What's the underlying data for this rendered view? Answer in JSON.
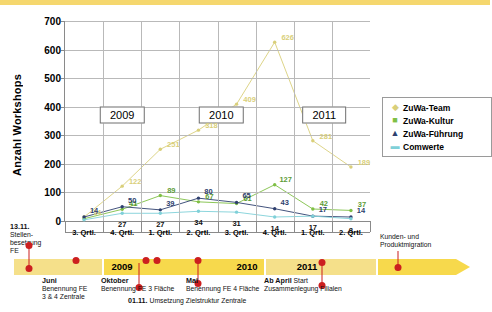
{
  "chart_data": {
    "type": "line",
    "title": "",
    "xlabel": "",
    "ylabel": "Anzahl Workshops",
    "ylim": [
      0,
      700
    ],
    "yticks": [
      0,
      100,
      200,
      300,
      400,
      500,
      600,
      700
    ],
    "grid": true,
    "legend_position": "right",
    "categories": [
      "3. Qrtl.",
      "4. Qrtl.",
      "1. Qrtl.",
      "2. Qrtl.",
      "3. Qrtl.",
      "4. Qrtl.",
      "1. Qrtl.",
      "2. Qrtl."
    ],
    "series": [
      {
        "name": "ZuWa-Team",
        "color": "#d9cf7a",
        "values": [
          14,
          122,
          251,
          318,
          409,
          626,
          281,
          189
        ]
      },
      {
        "name": "ZuWa-Kultur",
        "color": "#7fbf45",
        "values": [
          8,
          41,
          89,
          67,
          61,
          127,
          42,
          37
        ]
      },
      {
        "name": "ZuWa-Führung",
        "color": "#2e3f6e",
        "values": [
          14,
          50,
          39,
          80,
          65,
          43,
          17,
          14
        ]
      },
      {
        "name": "Comwerte",
        "color": "#7fd0d8",
        "values": [
          4,
          27,
          27,
          34,
          31,
          14,
          17,
          8
        ]
      }
    ],
    "year_bands": [
      {
        "label": "2009",
        "x_index": 1.0
      },
      {
        "label": "2010",
        "x_index": 3.6
      },
      {
        "label": "2011",
        "x_index": 6.3
      }
    ],
    "point_labels": [
      {
        "series": "ZuWa-Team",
        "index": 0,
        "text": "14"
      },
      {
        "series": "ZuWa-Team",
        "index": 1,
        "text": "122"
      },
      {
        "series": "ZuWa-Team",
        "index": 2,
        "text": "251"
      },
      {
        "series": "ZuWa-Team",
        "index": 3,
        "text": "318"
      },
      {
        "series": "ZuWa-Team",
        "index": 4,
        "text": "409"
      },
      {
        "series": "ZuWa-Team",
        "index": 5,
        "text": "626"
      },
      {
        "series": "ZuWa-Team",
        "index": 6,
        "text": "281"
      },
      {
        "series": "ZuWa-Team",
        "index": 7,
        "text": "189"
      },
      {
        "series": "ZuWa-Kultur",
        "index": 1,
        "text": "41"
      },
      {
        "series": "ZuWa-Kultur",
        "index": 2,
        "text": "89"
      },
      {
        "series": "ZuWa-Kultur",
        "index": 3,
        "text": "67"
      },
      {
        "series": "ZuWa-Kultur",
        "index": 4,
        "text": "61"
      },
      {
        "series": "ZuWa-Kultur",
        "index": 5,
        "text": "127"
      },
      {
        "series": "ZuWa-Kultur",
        "index": 6,
        "text": "42"
      },
      {
        "series": "ZuWa-Kultur",
        "index": 7,
        "text": "37"
      },
      {
        "series": "ZuWa-Führung",
        "index": 0,
        "text": "14"
      },
      {
        "series": "ZuWa-Führung",
        "index": 1,
        "text": "50"
      },
      {
        "series": "ZuWa-Führung",
        "index": 2,
        "text": "39"
      },
      {
        "series": "ZuWa-Führung",
        "index": 3,
        "text": "80"
      },
      {
        "series": "ZuWa-Führung",
        "index": 4,
        "text": "65"
      },
      {
        "series": "ZuWa-Führung",
        "index": 5,
        "text": "43"
      },
      {
        "series": "ZuWa-Führung",
        "index": 6,
        "text": "17"
      },
      {
        "series": "ZuWa-Führung",
        "index": 7,
        "text": "14"
      },
      {
        "series": "Comwerte",
        "index": 1,
        "text": "27"
      },
      {
        "series": "Comwerte",
        "index": 2,
        "text": "27"
      },
      {
        "series": "Comwerte",
        "index": 3,
        "text": "34"
      },
      {
        "series": "Comwerte",
        "index": 4,
        "text": "31"
      },
      {
        "series": "Comwerte",
        "index": 5,
        "text": "14"
      },
      {
        "series": "Comwerte",
        "index": 6,
        "text": "17"
      },
      {
        "series": "Comwerte",
        "index": 7,
        "text": "8"
      }
    ]
  },
  "legend": {
    "items": [
      {
        "label": "ZuWa-Team",
        "symbol": "◆",
        "color": "#d9cf7a"
      },
      {
        "label": "ZuWa-Kultur",
        "symbol": "■",
        "color": "#7fbf45"
      },
      {
        "label": "ZuWa-Führung",
        "symbol": "▲",
        "color": "#2e3f6e"
      },
      {
        "label": "Comwerte",
        "symbol": "▬",
        "color": "#7fd0d8"
      }
    ]
  },
  "timeline": {
    "years": [
      {
        "label": "2009"
      },
      {
        "label": "2010"
      },
      {
        "label": "2011"
      }
    ],
    "milestones": [
      {
        "title": "13.11.",
        "line2": "Stellen-",
        "line3": "besetzung",
        "line4": "FE"
      },
      {
        "title": "Juni",
        "line2": "Benennung FE",
        "line3": "3 & 4 Zentrale"
      },
      {
        "title": "Oktober",
        "line2": "Benennung FE 3 Fläche"
      },
      {
        "title": "01.11.",
        "line2": "Umsetzung Zielstruktur Zentrale"
      },
      {
        "title": "Mai",
        "line2": "Benennung FE 4 Fläche"
      },
      {
        "title": "Ab April",
        "line2": "Start",
        "line3": "Zusammenlegung Filialen"
      },
      {
        "title": "Kunden- und",
        "line2": "Produktmigration"
      }
    ]
  }
}
